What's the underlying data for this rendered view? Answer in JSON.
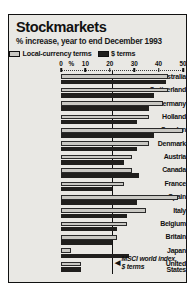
{
  "title": "Stockmarkets",
  "subtitle": "% increase, year to end December 1993",
  "legend": {
    "local_label": "Local-currency terms",
    "dollar_label": "$ terms",
    "local_color": "#c9c8c3",
    "dollar_color": "#201f1d"
  },
  "annotation": {
    "arrow": "◀",
    "line1": "MSCI world index,",
    "line2": "$ terms"
  },
  "chart_data": {
    "type": "bar",
    "orientation": "horizontal",
    "title": "Stockmarkets",
    "subtitle": "% increase, year to end December 1993",
    "xlabel": "%",
    "ylabel": "",
    "xlim": [
      0,
      50
    ],
    "xticks": [
      0,
      10,
      20,
      30,
      40,
      50
    ],
    "xtick_labels": [
      "0",
      "10",
      "20",
      "30",
      "40",
      "50"
    ],
    "percent_symbol_label": "%",
    "grid": false,
    "legend_position": "top-left",
    "reference_line": {
      "value": 21,
      "label": "MSCI world index, $ terms"
    },
    "categories": [
      "Australia",
      "Switzerland",
      "Germany",
      "Holland",
      "Sweden",
      "Denmark",
      "Austria",
      "Canada",
      "France",
      "Spain",
      "Italy",
      "Belgium",
      "Britain",
      "Japan",
      "United States"
    ],
    "series": [
      {
        "name": "Local-currency terms",
        "color": "#c9c8c3",
        "values": [
          44,
          44,
          42,
          36,
          50,
          36,
          29,
          29,
          26,
          48,
          35,
          27,
          23,
          4,
          8
        ]
      },
      {
        "name": "$ terms",
        "color": "#201f1d",
        "values": [
          43,
          38,
          36,
          31,
          38,
          31,
          26,
          32,
          21,
          31,
          27,
          23,
          21,
          28,
          8
        ]
      }
    ]
  }
}
